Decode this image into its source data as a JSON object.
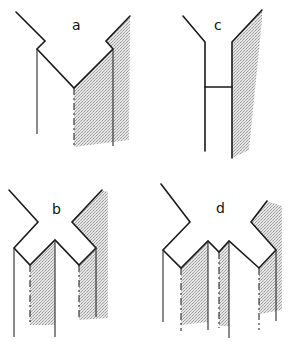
{
  "figure": {
    "panels": [
      {
        "id": "a",
        "label": "a"
      },
      {
        "id": "b",
        "label": "b"
      },
      {
        "id": "c",
        "label": "c"
      },
      {
        "id": "d",
        "label": "d"
      }
    ]
  },
  "colors": {
    "line": "#1a1a1a",
    "stipple": "#b0b0b0",
    "background": "#ffffff"
  }
}
